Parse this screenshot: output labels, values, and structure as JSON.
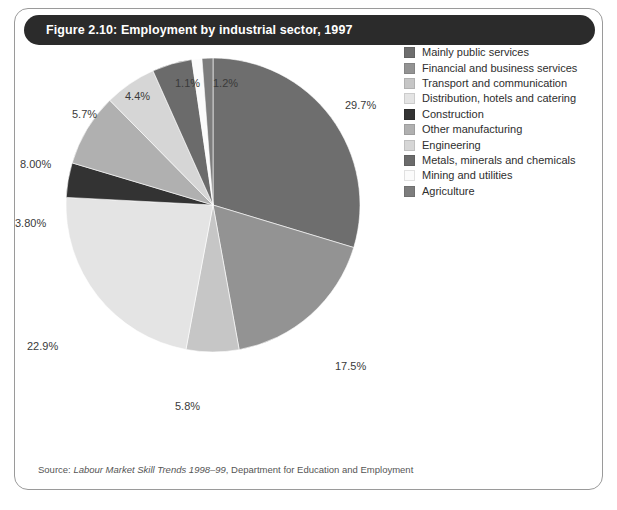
{
  "figure": {
    "title": "Figure 2.10: Employment by industrial sector, 1997",
    "source_prefix": "Source:",
    "source_italic": "Labour Market Skill Trends 1998–99",
    "source_rest": ", Department for Education and Employment"
  },
  "chart_data": {
    "type": "pie",
    "title": "Figure 2.10: Employment by industrial sector, 1997",
    "xlabel": "",
    "ylabel": "",
    "legend_position": "right",
    "grid": false,
    "units": "percent",
    "start_angle_deg": 0,
    "direction": "clockwise",
    "categories": [
      "Mainly public services",
      "Financial and business services",
      "Transport and communication",
      "Distribution, hotels and catering",
      "Construction",
      "Other manufacturing",
      "Engineering",
      "Metals, minerals and chemicals",
      "Mining and utilities",
      "Agriculture"
    ],
    "values": [
      29.7,
      17.5,
      5.8,
      22.9,
      3.8,
      8.0,
      5.7,
      4.4,
      1.1,
      1.2
    ],
    "labels": [
      "29.7%",
      "17.5%",
      "5.8%",
      "22.9%",
      "3.80%",
      "8.00%",
      "5.7%",
      "4.4%",
      "1.1%",
      "1.2%"
    ],
    "colors": [
      "#6e6e6e",
      "#939393",
      "#c6c6c6",
      "#e4e4e4",
      "#333333",
      "#b0b0b0",
      "#d6d6d6",
      "#6b6b6b",
      "#fbfbfb",
      "#7d7d7d"
    ],
    "slices": [
      {
        "name": "Mainly public services",
        "value": 29.7,
        "label": "29.7%",
        "color": "#6e6e6e"
      },
      {
        "name": "Financial and business services",
        "value": 17.5,
        "label": "17.5%",
        "color": "#939393"
      },
      {
        "name": "Transport and communication",
        "value": 5.8,
        "label": "5.8%",
        "color": "#c6c6c6"
      },
      {
        "name": "Distribution, hotels and catering",
        "value": 22.9,
        "label": "22.9%",
        "color": "#e4e4e4"
      },
      {
        "name": "Construction",
        "value": 3.8,
        "label": "3.80%",
        "color": "#333333"
      },
      {
        "name": "Other manufacturing",
        "value": 8.0,
        "label": "8.00%",
        "color": "#b0b0b0"
      },
      {
        "name": "Engineering",
        "value": 5.7,
        "label": "5.7%",
        "color": "#d6d6d6"
      },
      {
        "name": "Metals, minerals and chemicals",
        "value": 4.4,
        "label": "4.4%",
        "color": "#6b6b6b"
      },
      {
        "name": "Mining and utilities",
        "value": 1.1,
        "label": "1.1%",
        "color": "#fbfbfb"
      },
      {
        "name": "Agriculture",
        "value": 1.2,
        "label": "1.2%",
        "color": "#7d7d7d"
      }
    ]
  },
  "legend": {
    "items": [
      {
        "label": "Mainly public services",
        "color": "#6e6e6e"
      },
      {
        "label": "Financial and business services",
        "color": "#939393"
      },
      {
        "label": "Transport and communication",
        "color": "#c6c6c6"
      },
      {
        "label": "Distribution, hotels and catering",
        "color": "#e4e4e4"
      },
      {
        "label": "Construction",
        "color": "#333333"
      },
      {
        "label": "Other manufacturing",
        "color": "#b0b0b0"
      },
      {
        "label": "Engineering",
        "color": "#d6d6d6"
      },
      {
        "label": "Metals, minerals and chemicals",
        "color": "#6b6b6b"
      },
      {
        "label": "Mining and utilities",
        "color": "#fbfbfb"
      },
      {
        "label": "Agriculture",
        "color": "#7d7d7d"
      }
    ]
  },
  "label_positions": [
    {
      "label": "29.7%",
      "x": 330,
      "y": 54
    },
    {
      "label": "17.5%",
      "x": 320,
      "y": 315
    },
    {
      "label": "5.8%",
      "x": 160,
      "y": 355
    },
    {
      "label": "22.9%",
      "x": 12,
      "y": 295
    },
    {
      "label": "3.80%",
      "x": 0,
      "y": 172
    },
    {
      "label": "8.00%",
      "x": 5,
      "y": 113
    },
    {
      "label": "5.7%",
      "x": 57,
      "y": 63
    },
    {
      "label": "4.4%",
      "x": 110,
      "y": 45
    },
    {
      "label": "1.1%",
      "x": 160,
      "y": 32
    },
    {
      "label": "1.2%",
      "x": 198,
      "y": 32
    }
  ]
}
